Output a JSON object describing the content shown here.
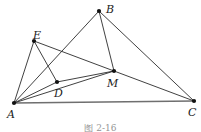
{
  "figure": {
    "caption": "图 2-16",
    "line_color": "#2b2b2b",
    "base_line_color": "#6f6f6f",
    "vertex_color": "#111111",
    "background": "#ffffff",
    "vertices": [
      {
        "id": "A",
        "label": "A",
        "x": 14,
        "y": 103,
        "label_x": 7,
        "label_y": 109
      },
      {
        "id": "B",
        "label": "B",
        "x": 99,
        "y": 11,
        "label_x": 106,
        "label_y": 4
      },
      {
        "id": "C",
        "label": "C",
        "x": 194,
        "y": 101,
        "label_x": 188,
        "label_y": 107
      },
      {
        "id": "D",
        "label": "D",
        "x": 57,
        "y": 82,
        "label_x": 54,
        "label_y": 88
      },
      {
        "id": "E",
        "label": "E",
        "x": 34,
        "y": 41,
        "label_x": 33,
        "label_y": 30
      },
      {
        "id": "M",
        "label": "M",
        "x": 114,
        "y": 71,
        "label_x": 107,
        "label_y": 78
      }
    ],
    "segments": [
      {
        "name": "segment-AB",
        "from": "A",
        "to": "B",
        "style": "thin"
      },
      {
        "name": "segment-AC",
        "from": "A",
        "to": "C",
        "style": "base"
      },
      {
        "name": "segment-AD",
        "from": "A",
        "to": "D",
        "style": "thin"
      },
      {
        "name": "segment-AE",
        "from": "A",
        "to": "E",
        "style": "thin"
      },
      {
        "name": "segment-AM",
        "from": "A",
        "to": "M",
        "style": "thin"
      },
      {
        "name": "segment-BC",
        "from": "B",
        "to": "C",
        "style": "thin"
      },
      {
        "name": "segment-BM",
        "from": "B",
        "to": "M",
        "style": "thin"
      },
      {
        "name": "segment-DE",
        "from": "D",
        "to": "E",
        "style": "thin"
      },
      {
        "name": "segment-DM",
        "from": "D",
        "to": "M",
        "style": "thin"
      },
      {
        "name": "segment-EC",
        "from": "E",
        "to": "C",
        "style": "thin"
      }
    ]
  }
}
